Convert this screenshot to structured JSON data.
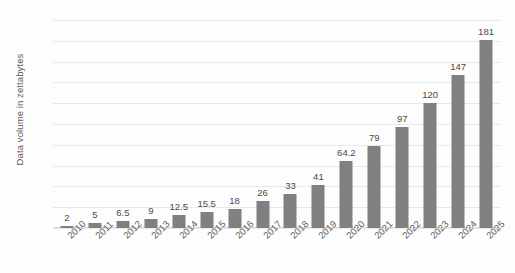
{
  "chart_data": {
    "type": "bar",
    "title": "",
    "xlabel": "",
    "ylabel": "Data volume in zettabytes",
    "ylim": [
      0,
      200
    ],
    "ytick_step": 20,
    "yticks": [
      "200",
      "180",
      "160",
      "140",
      "120",
      "100",
      "80",
      "60",
      "40",
      "20",
      "0"
    ],
    "grid": true,
    "legend": "none",
    "bar_color": "#808080",
    "gridline_color": "#e8e8e8",
    "label_color": "#4a4a4a",
    "categories": [
      "2010",
      "2011",
      "2012",
      "2013",
      "2014",
      "2015",
      "2016",
      "2017",
      "2018",
      "2019",
      "2020",
      "2021",
      "2022",
      "2023",
      "2024",
      "2025"
    ],
    "values": [
      2,
      5,
      6.5,
      9,
      12.5,
      15.5,
      18,
      26,
      33,
      41,
      64.2,
      79,
      97,
      120,
      147,
      181
    ],
    "value_labels": [
      "2",
      "5",
      "6.5",
      "9",
      "12.5",
      "15.5",
      "18",
      "26",
      "33",
      "41",
      "64.2",
      "79",
      "97",
      "120",
      "147",
      "181"
    ]
  }
}
